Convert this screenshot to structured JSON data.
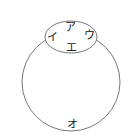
{
  "diagram": {
    "type": "venn",
    "shapes": [
      {
        "id": "large-circle",
        "kind": "circle",
        "cx": 71,
        "cy": 82,
        "r": 49
      },
      {
        "id": "small-ellipse",
        "kind": "ellipse",
        "cx": 71,
        "cy": 37,
        "rx": 26,
        "ry": 16
      }
    ],
    "labels": {
      "a": "ア",
      "i": "イ",
      "u": "ウ",
      "e": "エ",
      "o": "オ"
    },
    "stroke_color": "#777777"
  }
}
